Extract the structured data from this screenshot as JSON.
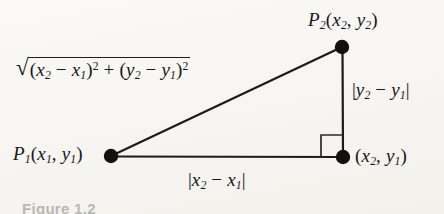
{
  "figure": {
    "kind": "geometry-diagram",
    "caption": "Figure 1.2",
    "background_color": "#f7f6f3",
    "ink_color": "#171717"
  },
  "labels": {
    "point_upper_right": {
      "name": "P",
      "name_sub": "2",
      "open": "(",
      "x_var": "x",
      "x_sub": "2",
      "comma": ", ",
      "y_var": "y",
      "y_sub": "2",
      "close": ")"
    },
    "point_lower_left": {
      "name": "P",
      "name_sub": "1",
      "open": "(",
      "x_var": "x",
      "x_sub": "1",
      "comma": ", ",
      "y_var": "y",
      "y_sub": "1",
      "close": ")"
    },
    "point_lower_right": {
      "open": "(",
      "x_var": "x",
      "x_sub": "2",
      "comma": ", ",
      "y_var": "y",
      "y_sub": "1",
      "close": ")"
    },
    "hypotenuse": {
      "radical": "√",
      "term1_open": "(",
      "term1_a": "x",
      "term1_a_sub": "2",
      "term1_minus": " − ",
      "term1_b": "x",
      "term1_b_sub": "1",
      "term1_close": ")",
      "term1_power": "2",
      "plus": " + ",
      "term2_open": "(",
      "term2_a": "y",
      "term2_a_sub": "2",
      "term2_minus": " − ",
      "term2_b": "y",
      "term2_b_sub": "1",
      "term2_close": ")",
      "term2_power": "2"
    },
    "vertical_leg": {
      "bar_open": "|",
      "a": "y",
      "a_sub": "2",
      "minus": " − ",
      "b": "y",
      "b_sub": "1",
      "bar_close": "|"
    },
    "horizontal_leg": {
      "bar_open": "|",
      "a": "x",
      "a_sub": "2",
      "minus": " − ",
      "b": "x",
      "b_sub": "1",
      "bar_close": "|"
    }
  },
  "geometry": {
    "vertex_upper_right": {
      "x": 342,
      "y": 47
    },
    "vertex_lower_left": {
      "x": 111,
      "y": 156
    },
    "vertex_lower_right": {
      "x": 343,
      "y": 157
    },
    "vertex_dot_radius": 7,
    "stroke_width": 2.2,
    "right_angle_marker": {
      "x": 321,
      "y": 135,
      "size": 15
    }
  }
}
